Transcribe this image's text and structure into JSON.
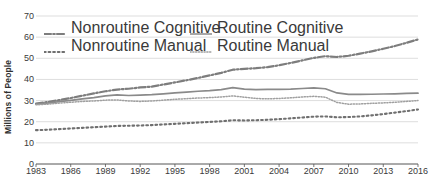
{
  "chart_data": {
    "type": "line",
    "title": "",
    "xlabel": "",
    "ylabel": "Millions of People",
    "ylim": [
      0,
      70
    ],
    "ytick_values": [
      0,
      10,
      20,
      30,
      40,
      50,
      60,
      70
    ],
    "xlim": [
      1983,
      2016
    ],
    "xtick_values": [
      1983,
      1986,
      1989,
      1992,
      1995,
      1998,
      2001,
      2004,
      2007,
      2010,
      2013,
      2016
    ],
    "grid": "horizontal",
    "legend_position": "top-inside",
    "x": [
      1983,
      1984,
      1985,
      1986,
      1987,
      1988,
      1989,
      1990,
      1991,
      1992,
      1993,
      1994,
      1995,
      1996,
      1997,
      1998,
      1999,
      2000,
      2001,
      2002,
      2003,
      2004,
      2005,
      2006,
      2007,
      2008,
      2009,
      2010,
      2011,
      2012,
      2013,
      2014,
      2015,
      2016
    ],
    "series": [
      {
        "name": "Nonroutine Cognitive",
        "style": "dash-dot",
        "color": "#7d7d7d",
        "values": [
          28.6,
          29.3,
          30.2,
          31.2,
          32.3,
          33.4,
          34.4,
          35.2,
          35.6,
          36.2,
          36.6,
          37.6,
          38.6,
          39.6,
          40.7,
          41.9,
          43.1,
          44.6,
          45.0,
          45.3,
          45.8,
          46.7,
          47.8,
          49.0,
          50.2,
          51.0,
          50.6,
          51.2,
          52.2,
          53.3,
          54.5,
          55.8,
          57.3,
          58.9
        ]
      },
      {
        "name": "Routine Cognitive",
        "style": "solid",
        "color": "#8a8a8a",
        "values": [
          28.3,
          28.8,
          29.5,
          30.1,
          30.8,
          31.4,
          32.2,
          32.7,
          32.4,
          32.6,
          32.8,
          33.2,
          33.6,
          34.0,
          34.4,
          34.7,
          35.2,
          36.1,
          35.4,
          35.2,
          35.3,
          35.3,
          35.4,
          35.7,
          36.0,
          35.6,
          33.6,
          32.9,
          32.9,
          33.0,
          33.1,
          33.2,
          33.4,
          33.5
        ]
      },
      {
        "name": "Routine Manual",
        "style": "dotted-fine",
        "color": "#a0a0a0",
        "values": [
          28.0,
          28.3,
          28.8,
          29.2,
          29.6,
          29.8,
          30.2,
          30.3,
          29.8,
          29.6,
          29.8,
          30.2,
          30.6,
          30.9,
          31.2,
          31.4,
          31.7,
          32.2,
          31.6,
          31.0,
          30.8,
          31.0,
          31.3,
          31.7,
          32.0,
          31.6,
          29.1,
          28.3,
          28.4,
          28.7,
          28.9,
          29.2,
          29.6,
          30.0
        ]
      },
      {
        "name": "Nonroutine Manual",
        "style": "dotted-bold",
        "color": "#6f6f6f",
        "values": [
          16.0,
          16.2,
          16.5,
          16.8,
          17.1,
          17.4,
          17.7,
          18.0,
          18.1,
          18.2,
          18.4,
          18.7,
          19.0,
          19.3,
          19.6,
          19.9,
          20.2,
          20.7,
          20.6,
          20.7,
          20.9,
          21.2,
          21.6,
          22.0,
          22.4,
          22.5,
          22.1,
          22.2,
          22.5,
          23.0,
          23.6,
          24.3,
          25.0,
          25.8
        ]
      }
    ],
    "legend_entries": [
      {
        "label": "Nonroutine Cognitive",
        "style": "dash-dot"
      },
      {
        "label": "Routine Cognitive",
        "style": "solid"
      },
      {
        "label": "Nonroutine Manual",
        "style": "dotted-bold"
      },
      {
        "label": "Routine Manual",
        "style": "dotted-fine"
      }
    ]
  }
}
